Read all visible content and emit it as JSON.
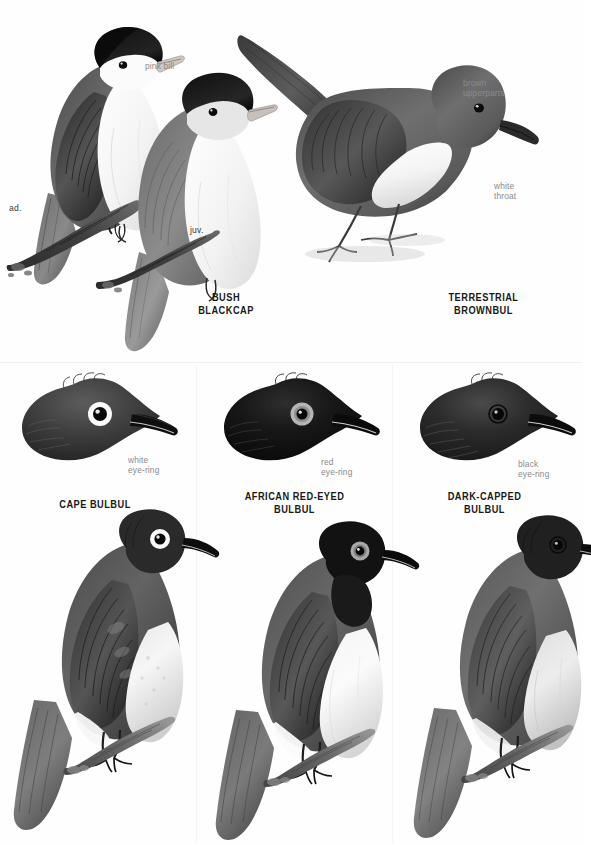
{
  "page": {
    "type": "field-guide-plate",
    "width": 582,
    "height": 845,
    "background": "#ffffff",
    "style": "monochrome graphite bird illustrations"
  },
  "palette": {
    "ink_dark": "#1c1c1c",
    "ink_mid": "#6a6a6a",
    "ink_light": "#b4b4b4",
    "annotation_gray": "#8a8a8a",
    "caption_black": "#191919",
    "paper": "#ffffff"
  },
  "panels": [
    {
      "id": "bush-blackcap",
      "species_label": "BUSH\nBLACKCAP",
      "figures": [
        {
          "id": "adult",
          "age_label": "ad."
        },
        {
          "id": "juvenile",
          "age_label": "juv."
        }
      ],
      "annotations": [
        {
          "id": "pink-bill",
          "text": "pink bill"
        }
      ]
    },
    {
      "id": "terrestrial-brownbul",
      "species_label": "TERRESTRIAL\nBROWNBUL",
      "figures": [
        {
          "id": "standing",
          "age_label": ""
        }
      ],
      "annotations": [
        {
          "id": "brown-upperparts",
          "text": "brown\nupperparts"
        },
        {
          "id": "white-throat",
          "text": "white\nthroat"
        }
      ]
    },
    {
      "id": "cape-bulbul",
      "species_label": "CAPE BULBUL",
      "annotations": [
        {
          "id": "white-eye-ring",
          "text": "white\neye-ring"
        }
      ]
    },
    {
      "id": "african-red-eyed-bulbul",
      "species_label": "AFRICAN RED-EYED\nBULBUL",
      "annotations": [
        {
          "id": "red-eye-ring",
          "text": "red\neye-ring"
        }
      ]
    },
    {
      "id": "dark-capped-bulbul",
      "species_label": "DARK-CAPPED\nBULBUL",
      "annotations": [
        {
          "id": "black-eye-ring",
          "text": "black\neye-ring"
        }
      ]
    }
  ]
}
